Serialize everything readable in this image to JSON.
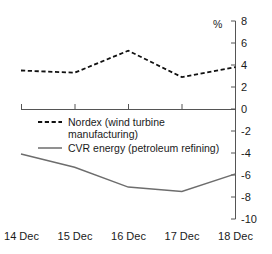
{
  "chart_data": {
    "type": "line",
    "title": "",
    "subtitle": "",
    "xlabel": "",
    "ylabel": "%",
    "categories": [
      "14 Dec",
      "15 Dec",
      "16 Dec",
      "17 Dec",
      "18 Dec"
    ],
    "ylim": [
      -10,
      8
    ],
    "yticks": [
      8,
      6,
      4,
      2,
      0,
      -2,
      -4,
      -6,
      -8,
      -10
    ],
    "ytick_labels": [
      "8",
      "6",
      "4",
      "2",
      "0",
      "-2",
      "-4",
      "-6",
      "-8",
      "-10"
    ],
    "y_axis_position": "right",
    "grid": false,
    "legend_position": "inside-center",
    "zero_line": true,
    "series": [
      {
        "name": "Nordex (wind turbine manufacturing)",
        "style": "dashed",
        "color": "#111111",
        "values": [
          3.5,
          3.3,
          5.3,
          2.9,
          3.8
        ]
      },
      {
        "name": "CVR energy (petroleum refining)",
        "style": "solid",
        "color": "#6d6d6d",
        "values": [
          -4.1,
          -5.3,
          -7.1,
          -7.5,
          -5.9
        ]
      }
    ]
  },
  "axis": {
    "unit_label": "%"
  },
  "legend": {
    "items": [
      {
        "label_line1": "Nordex (wind turbine",
        "label_line2": "manufacturing)",
        "style": "dashed"
      },
      {
        "label_line1": "CVR energy (petroleum refining)",
        "label_line2": "",
        "style": "solid"
      }
    ]
  },
  "xaxis": {
    "labels": [
      "14 Dec",
      "15 Dec",
      "16 Dec",
      "17 Dec",
      "18 Dec"
    ]
  }
}
